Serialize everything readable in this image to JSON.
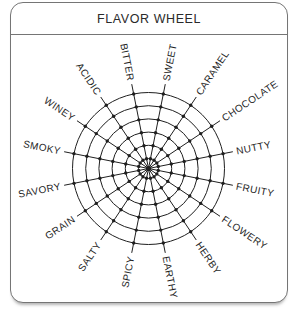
{
  "card": {
    "title": "FLAVOR WHEEL"
  },
  "chart_data": {
    "type": "radar",
    "title": "FLAVOR WHEEL",
    "categories": [
      "SWEET",
      "CARAMEL",
      "CHOCOLATE",
      "NUTTY",
      "FRUITY",
      "FLOWERY",
      "HERBY",
      "EARTHY",
      "SPICY",
      "SALTY",
      "GRAIN",
      "SAVORY",
      "SMOKY",
      "WINEY",
      "ACIDIC",
      "BITTER"
    ],
    "series": [],
    "rings": 6,
    "grid_dots": true,
    "start_angle_deg": 11.25,
    "angle_step_deg": 22.5,
    "center_px": {
      "x": 137.5,
      "y": 165.5
    },
    "ring_radii_px": [
      10,
      23.2,
      36.4,
      49.6,
      62.8,
      76
    ],
    "spoke_length_px": 86,
    "label_radius_px": 89.5,
    "dot_radius_px": 1.7,
    "center_dot_radius_px": 2.6,
    "line_color": "#1f1f1f",
    "label_color": "#1f1f1f",
    "border_color": "#757575",
    "background": "#ffffff"
  }
}
